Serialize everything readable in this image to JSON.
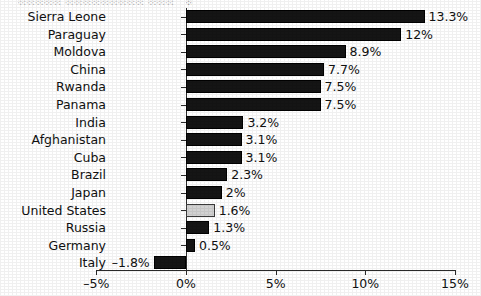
{
  "chart_data": {
    "type": "bar",
    "orientation": "horizontal",
    "title": "",
    "xlabel": "",
    "ylabel": "",
    "xlim": [
      -5,
      15
    ],
    "xticks": [
      -5,
      0,
      5,
      10,
      15
    ],
    "xtick_labels": [
      "–5%",
      "0%",
      "5%",
      "10%",
      "15%"
    ],
    "grid": false,
    "legend": "none",
    "categories": [
      "Sierra Leone",
      "Paraguay",
      "Moldova",
      "China",
      "Rwanda",
      "Panama",
      "India",
      "Afghanistan",
      "Cuba",
      "Brazil",
      "Japan",
      "United States",
      "Russia",
      "Germany",
      "Italy"
    ],
    "values": [
      13.3,
      12,
      8.9,
      7.7,
      7.5,
      7.5,
      3.2,
      3.1,
      3.1,
      2.3,
      2,
      1.6,
      1.3,
      0.5,
      -1.8
    ],
    "value_labels": [
      "13.3%",
      "12%",
      "8.9%",
      "7.7%",
      "7.5%",
      "7.5%",
      "3.2%",
      "3.1%",
      "3.1%",
      "2.3%",
      "2%",
      "1.6%",
      "1.3%",
      "0.5%",
      "–1.8%"
    ],
    "highlighted_category": "United States",
    "colors": {
      "bar": "#151515",
      "bar_highlight": "#d2d2d2",
      "axis": "#2a2a2a",
      "text": "#111111",
      "background": "#ffffff"
    }
  },
  "title_remnant": {
    "left": "░░░░░ ░░░░░░░░░ ░░░",
    "right": "░"
  }
}
